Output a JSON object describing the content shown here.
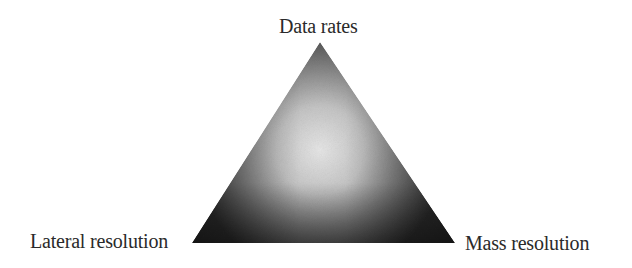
{
  "diagram": {
    "type": "triangle-tradeoff",
    "vertices": {
      "top": {
        "label": "Data rates"
      },
      "bottom_left": {
        "label": "Lateral resolution"
      },
      "bottom_right": {
        "label": "Mass resolution"
      }
    },
    "colors": {
      "edge_dark": "#333333",
      "center_light": "#e4e4e4",
      "text": "#2a2a2a",
      "background": "#ffffff"
    }
  }
}
